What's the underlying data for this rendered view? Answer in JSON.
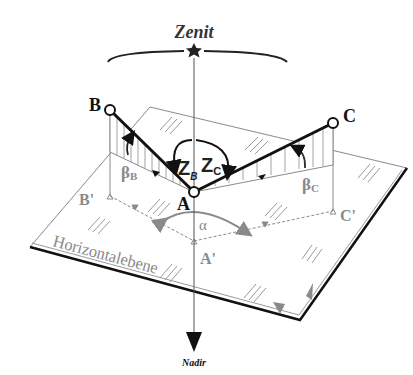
{
  "diagram": {
    "type": "geodetic-angle-diagram",
    "zenith_label": "Zenit",
    "nadir_label": "Nadir",
    "plane_label": "Horizontalebene",
    "points": {
      "A": "A",
      "B": "B",
      "C": "C",
      "A_proj": "A'",
      "B_proj": "B'",
      "C_proj": "C'"
    },
    "angles": {
      "horizontal": "α",
      "zenith_B_main": "Z",
      "zenith_B_sub": "B",
      "zenith_C_main": "Z",
      "zenith_C_sub": "C",
      "vertical_B_main": "β",
      "vertical_B_sub": "B",
      "vertical_C_main": "β",
      "vertical_C_sub": "C"
    },
    "colors": {
      "ink": "#111111",
      "plane": "#8a8a8a",
      "background": "#ffffff"
    }
  }
}
